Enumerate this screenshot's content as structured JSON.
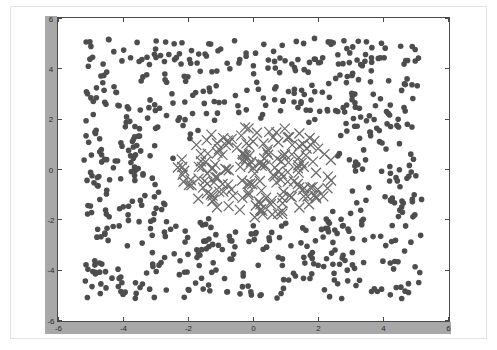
{
  "figure": {
    "kind": "scatter-plot",
    "background_color": "#ffffff",
    "axis_band_color": "#a8a8a8",
    "frame_color": "#4a4a4a",
    "outer_border_color": "#e3e3e3"
  },
  "axes": {
    "x_ticks": [
      "-6",
      "-4",
      "-2",
      "0",
      "2",
      "4",
      "6"
    ],
    "y_ticks": [
      "6",
      "4",
      "2",
      "0",
      "-2",
      "-4",
      "-6"
    ]
  },
  "chart_data": {
    "type": "scatter",
    "title": "",
    "xlabel": "",
    "ylabel": "",
    "xlim": [
      -6,
      6
    ],
    "ylim": [
      -6,
      6
    ],
    "xticks": [
      -6,
      -4,
      -2,
      0,
      2,
      4,
      6
    ],
    "yticks": [
      -6,
      -4,
      -2,
      0,
      2,
      4,
      6
    ],
    "grid": false,
    "legend": null,
    "series": [
      {
        "name": "outer-ring-class",
        "marker": "o",
        "marker_size": 5.6,
        "color": "#4d4d4d",
        "count": 660,
        "description": "Filled dark-gray circles uniformly scattered in the square region x in [-5.2, 5.2], y in [-5.2, 5.2], excluding a roughly elliptical hole in the middle occupied by the second class.",
        "distribution": {
          "shape": "uniform-square-with-central-hole",
          "x_range": [
            -5.2,
            5.2
          ],
          "y_range": [
            -5.2,
            5.2
          ],
          "hole_center": [
            0.1,
            -0.1
          ],
          "hole_radius_x": 2.6,
          "hole_radius_y": 2.1
        }
      },
      {
        "name": "inner-cluster-class",
        "marker": "x",
        "marker_size": 5.0,
        "color": "#6b6b6b",
        "count": 175,
        "description": "Gray x-shaped crosses forming the dense central blob.",
        "distribution": {
          "shape": "uniform-ellipse",
          "center": [
            0.1,
            -0.1
          ],
          "radius_x": 2.45,
          "radius_y": 1.85
        }
      }
    ]
  }
}
